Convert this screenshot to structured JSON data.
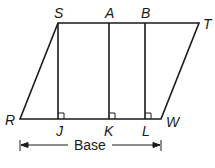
{
  "figure": {
    "type": "parallelogram-with-heights",
    "vertices": {
      "S": {
        "label": "S",
        "x": 58,
        "y": 23
      },
      "T": {
        "label": "T",
        "x": 199,
        "y": 23
      },
      "R": {
        "label": "R",
        "x": 20,
        "y": 119
      },
      "W": {
        "label": "W",
        "x": 161,
        "y": 119
      }
    },
    "top_points": {
      "A": {
        "label": "A",
        "x": 109,
        "y": 23
      },
      "B": {
        "label": "B",
        "x": 145,
        "y": 23
      }
    },
    "feet": {
      "J": {
        "label": "J",
        "x": 58,
        "y": 119
      },
      "K": {
        "label": "K",
        "x": 109,
        "y": 119
      },
      "L": {
        "label": "L",
        "x": 145,
        "y": 119
      }
    },
    "base_label": "Base",
    "stroke_color": "#1a1a1a"
  }
}
